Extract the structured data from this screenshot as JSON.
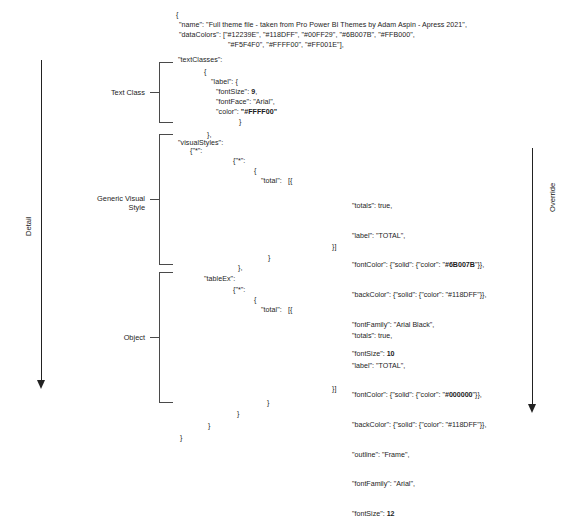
{
  "axes": {
    "left": {
      "label": "Detail"
    },
    "right": {
      "label": "Override"
    }
  },
  "groups": [
    {
      "label": "Text Class"
    },
    {
      "label": "Generic Visual\nStyle"
    },
    {
      "label": "Object"
    }
  ],
  "code": {
    "open_brace": "{",
    "name_line": "\"name\": \"Full theme file - taken from Pro Power BI Themes by Adam Aspin - Apress 2021\",",
    "datacolors_line1": "\"dataColors\": [\"#12239E\", \"#118DFF\", \"#00FF29\", \"#6B007B\", \"#FFB000\",",
    "datacolors_line2": "\"#F5F4F0\", \"#FFFF00\", \"#FF001E\"],",
    "textclasses_key": "\"textClasses\":",
    "textclasses_open": "{",
    "label_key": "\"label\": {",
    "fontsize_line": "\"fontSize\": 9,",
    "fontface_line": "\"fontFace\": \"Arial\",",
    "color_line": "\"color\": \"#FFFF00\"",
    "label_close": "}",
    "textclasses_close": "},",
    "visualstyles_key": "\"visualStyles\":",
    "visualstyles_star1": "{\"*\":",
    "visualstyles_star2": "{\"*\":",
    "visualstyles_brace": "{",
    "visualstyles_total": "\"total\":   [{",
    "visualstyles_close_arr": "}]",
    "visualstyles_close1": "}",
    "visualstyles_close2": "},",
    "tableex_key": "\"tableEx\":",
    "tableex_star": "{\"*\":",
    "tableex_brace": "{",
    "tableex_total": "\"total\":   [{",
    "tableex_close_arr": "}]",
    "tail_close1": "}",
    "tail_close2": "}",
    "tail_close3": "}",
    "tail_close4": "}"
  },
  "panels": {
    "generic_visual_style": {
      "totals": "\"totals\": true,",
      "label": "\"label\": \"TOTAL\",",
      "font_color_pre": "\"fontColor\": {\"solid\": {\"color\": \"",
      "font_color_value": "#6B007B",
      "font_color_post": "\"}},",
      "back_color_pre": "\"backColor\": {\"solid\": {\"color\": \"",
      "back_color_value": "#118DFF",
      "back_color_post": "\"}},",
      "font_family": "\"fontFamily\": \"Arial Black\",",
      "font_size_pre": "\"fontSize\": ",
      "font_size_value": "10"
    },
    "object": {
      "totals": "\"totals\": true,",
      "label": "\"label\": \"TOTAL\",",
      "font_color_pre": "\"fontColor\": {\"solid\": {\"color\": \"",
      "font_color_value": "#000000",
      "font_color_post": "\"}},",
      "back_color_pre": "\"backColor\": {\"solid\": {\"color\": \"",
      "back_color_value": "#118DFF",
      "back_color_post": "\"}},",
      "outline": "\"outline\": \"Frame\",",
      "font_family": "\"fontFamily\": \"Arial\",",
      "font_size_pre": "\"fontSize\": ",
      "font_size_value": "12"
    }
  }
}
